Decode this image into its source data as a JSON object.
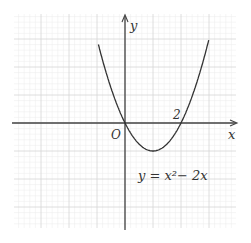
{
  "figure": {
    "equation_label": "y = x²− 2x",
    "axis_x_label": "x",
    "axis_y_label": "y",
    "origin_label": "O",
    "tick_label_2": "2",
    "colors": {
      "grid_major": "#d6d6d6",
      "grid_minor": "#ececec",
      "axis": "#444444",
      "curve": "#333333"
    }
  },
  "chart_data": {
    "type": "line",
    "xlabel": "x",
    "ylabel": "y",
    "x": [
      -0.9,
      -0.5,
      0,
      0.5,
      1,
      1.5,
      2,
      2.5,
      2.95
    ],
    "series": [
      {
        "name": "y = x^2 - 2x",
        "values": [
          2.61,
          1.25,
          0,
          -0.75,
          -1,
          -0.75,
          0,
          1.25,
          2.8
        ]
      }
    ],
    "annotations": [
      "O",
      "2",
      "y = x² − 2x"
    ],
    "xlim": [
      -4,
      4
    ],
    "ylim": [
      -3.8,
      3.9
    ],
    "grid": true,
    "roots": [
      0,
      2
    ],
    "vertex": [
      1,
      -1
    ]
  }
}
